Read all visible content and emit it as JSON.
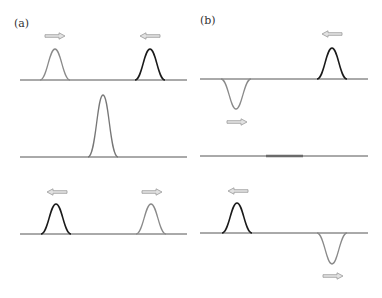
{
  "panels": [
    {
      "label": "(a)"
    },
    {
      "label": "(b)"
    }
  ],
  "colors": {
    "baseline": "#555555",
    "pulse_dark": "#1a1a1a",
    "pulse_light": "#8a8a8a",
    "arrow": "#999999",
    "bar": "#6a6a6a"
  },
  "diagram": {
    "panel_a_rows": [
      {
        "pulses": [
          {
            "x": 55,
            "shape": "up",
            "shade": "light",
            "arrow": "right"
          },
          {
            "x": 150,
            "shape": "up",
            "shade": "dark",
            "arrow": "left"
          }
        ]
      },
      {
        "pulses": [
          {
            "x": 103,
            "shape": "up-tall",
            "shade": "light"
          }
        ]
      },
      {
        "pulses": [
          {
            "x": 56,
            "shape": "up",
            "shade": "dark",
            "arrow": "left"
          },
          {
            "x": 151,
            "shape": "up",
            "shade": "light",
            "arrow": "right"
          }
        ]
      }
    ],
    "panel_b_rows": [
      {
        "pulses": [
          {
            "x": 236,
            "shape": "down",
            "shade": "light",
            "arrow": "right"
          },
          {
            "x": 332,
            "shape": "up",
            "shade": "dark",
            "arrow": "left"
          }
        ]
      },
      {
        "pulses": [
          {
            "x1": 266,
            "x2": 303,
            "shape": "flat-cancelled"
          }
        ]
      },
      {
        "pulses": [
          {
            "x": 237,
            "shape": "up",
            "shade": "dark",
            "arrow": "left"
          },
          {
            "x": 332,
            "shape": "down",
            "shade": "light",
            "arrow": "right"
          }
        ]
      }
    ]
  }
}
